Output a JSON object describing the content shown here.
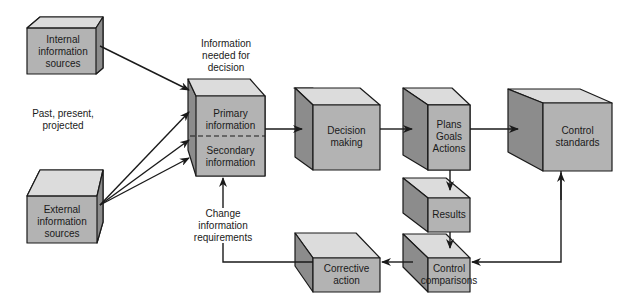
{
  "colors": {
    "front": "#b3b3b3",
    "top": "#dcdcdc",
    "side": "#8c8c8c",
    "stroke": "#1a1a1a",
    "background": "#ffffff"
  },
  "nodes": {
    "internal": {
      "label": "Internal\ninformation\nsources"
    },
    "external": {
      "label": "External\ninformation\nsources"
    },
    "primary": {
      "label": "Primary\ninformation"
    },
    "secondary": {
      "label": "Secondary\ninformation"
    },
    "decision": {
      "label": "Decision\nmaking"
    },
    "plans": {
      "label": "Plans\nGoals\nActions"
    },
    "control_standards": {
      "label": "Control\nstandards"
    },
    "results": {
      "label": "Results"
    },
    "control_comparisons": {
      "label": "Control\ncomparisons"
    },
    "corrective": {
      "label": "Corrective\naction"
    }
  },
  "annotations": {
    "info_needed": "Information\nneeded for\ndecision",
    "time_frame": "Past, present,\nprojected",
    "change_req": "Change\ninformation\nrequirements"
  }
}
